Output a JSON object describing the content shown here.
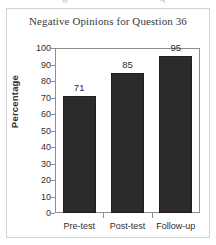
{
  "figure": {
    "cutoff_text_left": "g",
    "cutoff_text_right": "Q"
  },
  "chart_data": {
    "type": "bar",
    "title": "Negative Opinions for Question 36",
    "xlabel": "",
    "ylabel": "Percentage",
    "categories": [
      "Pre-test",
      "Post-test",
      "Follow-up"
    ],
    "values": [
      71,
      85,
      95
    ],
    "data_labels": [
      "71",
      "85",
      "95"
    ],
    "ylim": [
      0,
      100
    ],
    "ytick_step": 10,
    "yticks": [
      100,
      90,
      80,
      70,
      60,
      50,
      40,
      30,
      20,
      10,
      0
    ],
    "ytick_labels": [
      "100",
      "90",
      "80",
      "70",
      "60",
      "50",
      "40",
      "30",
      "20",
      "10",
      "0"
    ],
    "grid": false,
    "legend": false,
    "bar_color": "#2b2b2b",
    "axis_color": "#8f8f8f",
    "frame_color": "#d2d2d2",
    "background": "#ffffff"
  }
}
